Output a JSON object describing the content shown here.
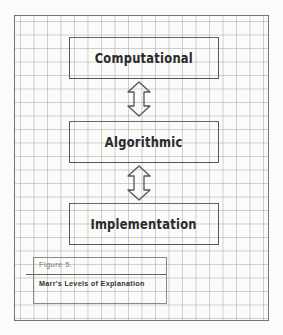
{
  "diagram": {
    "levels": [
      {
        "label": "Computational"
      },
      {
        "label": "Algorithmic"
      },
      {
        "label": "Implementation"
      }
    ],
    "connectors": [
      {
        "from": "Computational",
        "to": "Algorithmic",
        "type": "double-arrow"
      },
      {
        "from": "Algorithmic",
        "to": "Implementation",
        "type": "double-arrow"
      }
    ],
    "caption": {
      "figure_number": "Figure  5.",
      "title": "Marr's Levels of Explanation"
    }
  }
}
